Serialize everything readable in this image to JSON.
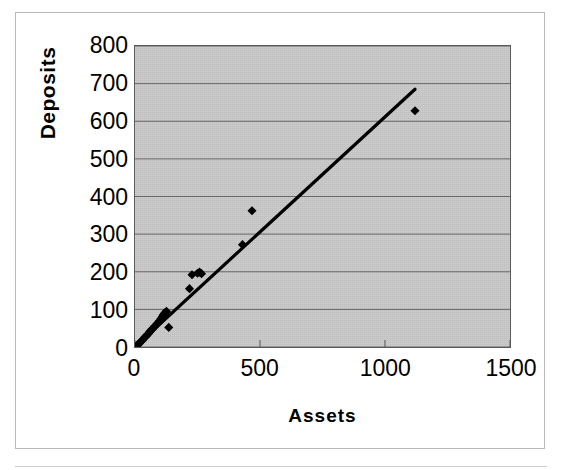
{
  "chart_data": {
    "type": "scatter",
    "title": "",
    "xlabel": "Assets",
    "ylabel": "Deposits",
    "xlim": [
      0,
      1500
    ],
    "ylim": [
      0,
      800
    ],
    "xticks": [
      "0",
      "500",
      "1000",
      "1500"
    ],
    "xtick_values": [
      0,
      500,
      1000,
      1500
    ],
    "yticks": [
      "0",
      "100",
      "200",
      "300",
      "400",
      "500",
      "600",
      "700",
      "800"
    ],
    "ytick_values": [
      0,
      100,
      200,
      300,
      400,
      500,
      600,
      700,
      800
    ],
    "grid": "horizontal",
    "legend": "none",
    "plot_background": "#c3c3c3",
    "marker_color": "#000000",
    "marker_shape": "diamond",
    "trendline": {
      "label": "linear fit",
      "color": "#000000",
      "x_start": 0,
      "y_start": 0,
      "x_end": 1120,
      "y_end": 685,
      "slope": 0.6116,
      "intercept": 0
    },
    "points": [
      {
        "x": 5,
        "y": 2
      },
      {
        "x": 8,
        "y": 4
      },
      {
        "x": 12,
        "y": 6
      },
      {
        "x": 15,
        "y": 8
      },
      {
        "x": 18,
        "y": 10
      },
      {
        "x": 22,
        "y": 13
      },
      {
        "x": 26,
        "y": 16
      },
      {
        "x": 30,
        "y": 18
      },
      {
        "x": 34,
        "y": 22
      },
      {
        "x": 38,
        "y": 25
      },
      {
        "x": 42,
        "y": 28
      },
      {
        "x": 46,
        "y": 30
      },
      {
        "x": 50,
        "y": 33
      },
      {
        "x": 55,
        "y": 36
      },
      {
        "x": 58,
        "y": 40
      },
      {
        "x": 62,
        "y": 43
      },
      {
        "x": 66,
        "y": 46
      },
      {
        "x": 70,
        "y": 48
      },
      {
        "x": 75,
        "y": 52
      },
      {
        "x": 80,
        "y": 56
      },
      {
        "x": 86,
        "y": 60
      },
      {
        "x": 92,
        "y": 64
      },
      {
        "x": 98,
        "y": 70
      },
      {
        "x": 104,
        "y": 76
      },
      {
        "x": 110,
        "y": 82
      },
      {
        "x": 114,
        "y": 86
      },
      {
        "x": 118,
        "y": 90
      },
      {
        "x": 122,
        "y": 92
      },
      {
        "x": 126,
        "y": 95
      },
      {
        "x": 135,
        "y": 52
      },
      {
        "x": 218,
        "y": 155
      },
      {
        "x": 228,
        "y": 192
      },
      {
        "x": 250,
        "y": 196
      },
      {
        "x": 258,
        "y": 199
      },
      {
        "x": 266,
        "y": 195
      },
      {
        "x": 430,
        "y": 272
      },
      {
        "x": 468,
        "y": 362
      },
      {
        "x": 1120,
        "y": 628
      }
    ]
  }
}
